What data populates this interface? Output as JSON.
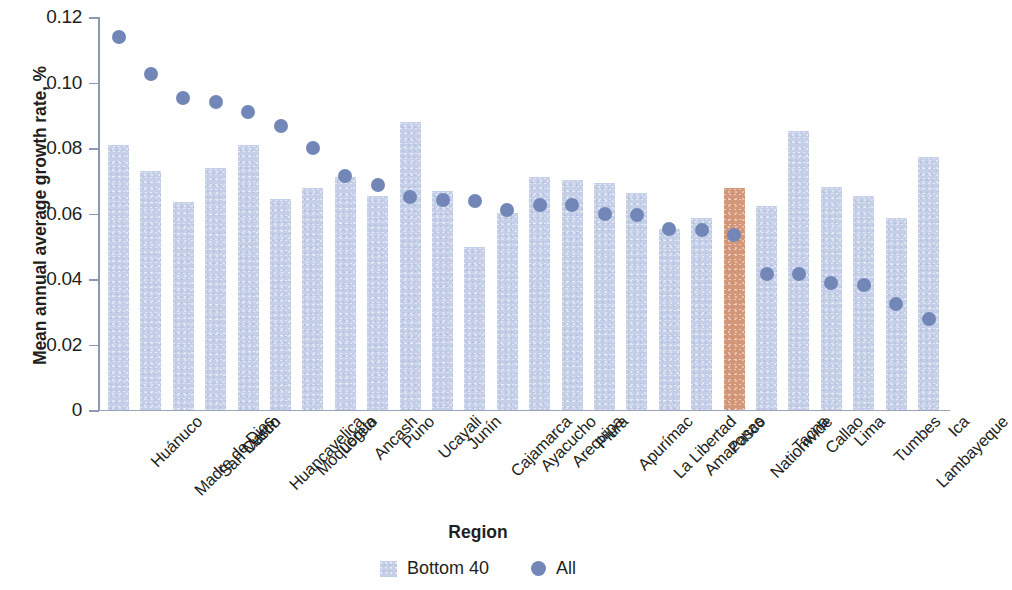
{
  "chart_data": {
    "type": "bar",
    "title": "",
    "xlabel": "Region",
    "ylabel": "Mean annual average growth rate, %",
    "ylim": [
      0,
      0.12
    ],
    "yticks": [
      0,
      0.02,
      0.04,
      0.06,
      0.08,
      0.1,
      0.12
    ],
    "ytick_labels": [
      "0",
      "0.02",
      "0.04",
      "0.06",
      "0.08",
      "0.10",
      "0.12"
    ],
    "grid": false,
    "legend_position": "bottom-center",
    "categories": [
      "Huánuco",
      "Madre de Dios",
      "San Martín",
      "Cusco",
      "Huancavelica",
      "Moquegua",
      "Loreto",
      "Ancash",
      "Puno",
      "Ucayali",
      "Junín",
      "Cajamarca",
      "Ayacucho",
      "Arequipa",
      "Piura",
      "Apurímac",
      "La Libertad",
      "Amazonas",
      "Pasco",
      "Nationwide",
      "Tacna",
      "Callao",
      "Lima",
      "Tumbes",
      "Lambayeque",
      "Ica"
    ],
    "highlight_category": "Nationwide",
    "highlight_color": "#d4977a",
    "bar_color": "#c5d0e8",
    "dot_color": "#7287b8",
    "series": [
      {
        "name": "Bottom 40",
        "type": "bar",
        "values": [
          0.081,
          0.0731,
          0.0634,
          0.074,
          0.0808,
          0.0643,
          0.0677,
          0.071,
          0.0652,
          0.0878,
          0.0668,
          0.0497,
          0.0602,
          0.0712,
          0.0702,
          0.0692,
          0.0663,
          0.0553,
          0.0587,
          0.0678,
          0.0623,
          0.0851,
          0.0681,
          0.0652,
          0.0585,
          0.0774
        ]
      },
      {
        "name": "All",
        "type": "scatter",
        "values": [
          0.1138,
          0.1025,
          0.0954,
          0.0942,
          0.091,
          0.0868,
          0.0799,
          0.0715,
          0.0687,
          0.0651,
          0.0642,
          0.0637,
          0.061,
          0.0625,
          0.0625,
          0.06,
          0.0594,
          0.0554,
          0.0551,
          0.0534,
          0.0416,
          0.0414,
          0.0389,
          0.0381,
          0.0324,
          0.0277
        ]
      }
    ]
  },
  "legend": {
    "entries": [
      {
        "label": "Bottom 40",
        "marker": "square-swatch-icon",
        "color": "#c5d0e8"
      },
      {
        "label": "All",
        "marker": "circle-marker-icon",
        "color": "#7287b8"
      }
    ]
  }
}
